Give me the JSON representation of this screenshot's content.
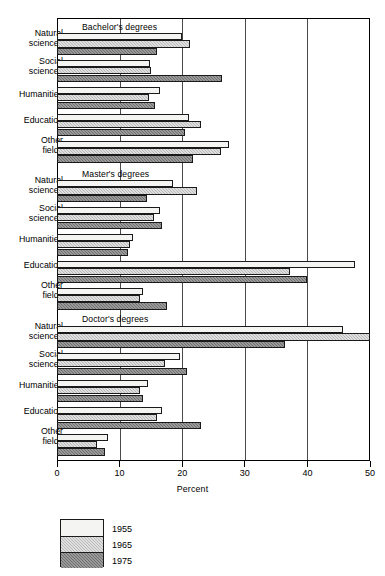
{
  "chart_data": {
    "type": "bar",
    "orientation": "horizontal",
    "title": "",
    "xlabel": "Percent",
    "ylabel": "",
    "xlim": [
      0,
      50
    ],
    "xticks": [
      0,
      10,
      20,
      30,
      40,
      50
    ],
    "grid": true,
    "legend_position": "bottom-left",
    "legend": [
      "1955",
      "1965",
      "1975"
    ],
    "series_names": [
      "1955",
      "1965",
      "1975"
    ],
    "categories": [
      "Natural sciences",
      "Social sciences",
      "Humanities",
      "Education",
      "Other fields"
    ],
    "panels": [
      {
        "title": "Bachelor's degrees",
        "categories": [
          "Natural sciences",
          "Social sciences",
          "Humanities",
          "Education",
          "Other fields"
        ],
        "series": [
          {
            "name": "1955",
            "values": [
              20.0,
              14.9,
              16.5,
              21.1,
              27.4
            ]
          },
          {
            "name": "1965",
            "values": [
              21.2,
              15.0,
              14.7,
              23.0,
              26.2
            ]
          },
          {
            "name": "1975",
            "values": [
              16.0,
              26.3,
              15.6,
              20.4,
              21.8
            ]
          }
        ]
      },
      {
        "title": "Master's degrees",
        "categories": [
          "Natural sciences",
          "Social sciences",
          "Humanities",
          "Education",
          "Other fields"
        ],
        "series": [
          {
            "name": "1955",
            "values": [
              18.5,
              16.5,
              12.1,
              47.6,
              13.7
            ]
          },
          {
            "name": "1965",
            "values": [
              22.3,
              15.5,
              11.6,
              37.2,
              13.2
            ]
          },
          {
            "name": "1975",
            "values": [
              14.3,
              16.8,
              11.3,
              40.0,
              17.5
            ]
          }
        ]
      },
      {
        "title": "Doctor's degrees",
        "categories": [
          "Natural sciences",
          "Social sciences",
          "Humanities",
          "Education",
          "Other fields"
        ],
        "series": [
          {
            "name": "1955",
            "values": [
              45.7,
              19.7,
              14.5,
              16.8,
              8.1
            ]
          },
          {
            "name": "1965",
            "values": [
              50.0,
              17.3,
              13.2,
              15.9,
              6.4
            ]
          },
          {
            "name": "1975",
            "values": [
              36.4,
              20.7,
              13.7,
              23.0,
              7.6
            ]
          }
        ]
      }
    ],
    "colors": {
      "1955": "#f4f4f2",
      "1965": "#b9b9b9",
      "1975": "#6e6e6e",
      "axis": "#000000",
      "grid": "#4a4a4a"
    }
  },
  "axis": {
    "tick_labels": [
      "0",
      "10",
      "20",
      "30",
      "40",
      "50"
    ],
    "title": "Percent"
  },
  "legend": {
    "items": [
      {
        "label": "1955"
      },
      {
        "label": "1965"
      },
      {
        "label": "1975"
      }
    ]
  },
  "panel_titles": {
    "bachelors": "Bachelor's degrees",
    "masters": "Master's degrees",
    "doctors": "Doctor's degrees"
  },
  "category_labels": {
    "natural": {
      "line1": "Natural",
      "line2": "sciences"
    },
    "social": {
      "line1": "Social",
      "line2": "sciences"
    },
    "humanities": {
      "line1": "Humanities",
      "line2": ""
    },
    "education": {
      "line1": "Education",
      "line2": ""
    },
    "other": {
      "line1": "Other",
      "line2": "fields"
    }
  }
}
